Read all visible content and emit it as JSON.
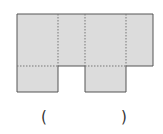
{
  "diagram": {
    "type": "box-net",
    "colors": {
      "fill": "#dcdcdc",
      "edge": "#555555",
      "fold": "#777777"
    },
    "top_row": {
      "x": 17,
      "y": 14,
      "w": 136,
      "h": 52
    },
    "fold_lines_vertical_x": [
      58,
      85,
      126
    ],
    "bottom_flaps": [
      {
        "x": 17,
        "y": 66,
        "w": 41,
        "h": 26
      },
      {
        "x": 85,
        "y": 66,
        "w": 41,
        "h": 26
      }
    ]
  },
  "answer": {
    "open": "(",
    "close": ")",
    "value": ""
  }
}
